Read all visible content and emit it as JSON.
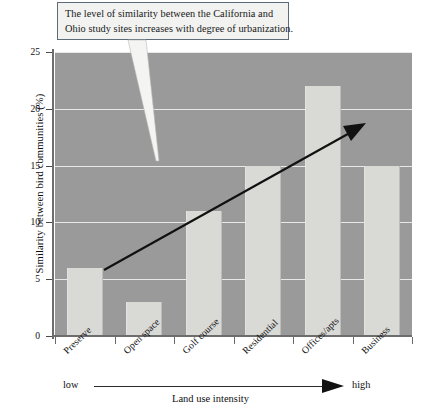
{
  "callout": {
    "line1": "The level of similarity between the California and",
    "line2": "Ohio study sites increases with degree of urbanization."
  },
  "axis": {
    "y_title": "Similarity between bird communities (%)",
    "x_title": "Land use intensity",
    "low_label": "low",
    "high_label": "high",
    "y_ticks": [
      "0",
      "5",
      "10",
      "15",
      "20",
      "25"
    ]
  },
  "categories": [
    "Preserve",
    "Open space",
    "Golf course",
    "Residential",
    "Offices/apts",
    "Business"
  ],
  "colors": {
    "plot_background": "#9a9a9a",
    "bar_fill": "#d9d9d6",
    "gridline": "#efefef",
    "axis": "#6d6d6d",
    "annotation_arrow": "#111111",
    "callout_border": "#5d6b78",
    "callout_fill": "#f2f2f0"
  },
  "chart_data": {
    "type": "bar",
    "title": "",
    "subtitle": "",
    "categories": [
      "Preserve",
      "Open space",
      "Golf course",
      "Residential",
      "Offices/apts",
      "Business"
    ],
    "values": [
      6,
      3,
      11,
      15,
      22,
      15
    ],
    "xlabel": "Land use intensity",
    "ylabel": "Similarity between bird communities (%)",
    "ylim": [
      0,
      25
    ],
    "yticks": [
      0,
      5,
      10,
      15,
      20,
      25
    ],
    "grid": true,
    "legend": "none",
    "annotations": [
      {
        "kind": "callout-text",
        "text": "The level of similarity between the California and Ohio study sites increases with degree of urbanization.",
        "points_to": "plot-interior"
      },
      {
        "kind": "trend-arrow",
        "text": "",
        "from_category": "Open space",
        "to_category": "Offices/apts",
        "direction": "increasing"
      },
      {
        "kind": "intensity-scale",
        "text": "low → high"
      }
    ]
  }
}
